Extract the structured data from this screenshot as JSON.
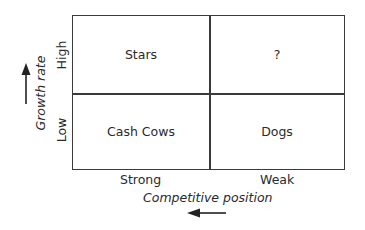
{
  "diagram": {
    "type": "2x2 matrix",
    "quadrants": [
      {
        "position": "top-left",
        "label": "Stars"
      },
      {
        "position": "top-right",
        "label": "?"
      },
      {
        "position": "bottom-left",
        "label": "Cash Cows"
      },
      {
        "position": "bottom-right",
        "label": "Dogs"
      }
    ],
    "y_axis": {
      "label": "Growth rate",
      "ticks": [
        "High",
        "Low"
      ],
      "arrow_direction": "up"
    },
    "x_axis": {
      "label": "Competitive position",
      "ticks": [
        "Strong",
        "Weak"
      ],
      "arrow_direction": "left"
    },
    "colors": {
      "line": "#3a3a3a",
      "text": "#2a2a2a",
      "background": "#ffffff"
    }
  }
}
